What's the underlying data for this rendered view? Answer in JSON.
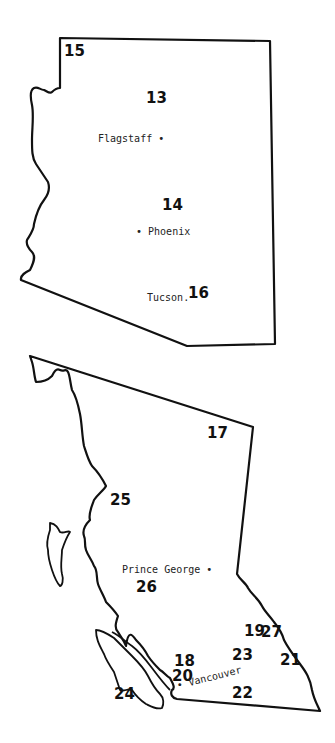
{
  "maps": [
    {
      "region": "Arizona",
      "markers": [
        {
          "id": "15",
          "x": 64,
          "y": 44
        },
        {
          "id": "13",
          "x": 146,
          "y": 91
        },
        {
          "id": "14",
          "x": 162,
          "y": 198
        },
        {
          "id": "16",
          "x": 188,
          "y": 286
        }
      ],
      "cities": [
        {
          "name": "Flagstaff",
          "x": 98,
          "y": 134,
          "dot": "after"
        },
        {
          "name": "Phoenix",
          "x": 136,
          "y": 227,
          "dot": "before"
        },
        {
          "name": "Tucson",
          "x": 147,
          "y": 293,
          "dot": "after"
        }
      ]
    },
    {
      "region": "British Columbia",
      "markers": [
        {
          "id": "17",
          "x": 207,
          "y": 426
        },
        {
          "id": "25",
          "x": 110,
          "y": 493
        },
        {
          "id": "26",
          "x": 136,
          "y": 580
        },
        {
          "id": "19",
          "x": 244,
          "y": 624
        },
        {
          "id": "27",
          "x": 261,
          "y": 625
        },
        {
          "id": "23",
          "x": 232,
          "y": 648
        },
        {
          "id": "21",
          "x": 280,
          "y": 653
        },
        {
          "id": "18",
          "x": 174,
          "y": 654
        },
        {
          "id": "20",
          "x": 172,
          "y": 669
        },
        {
          "id": "22",
          "x": 232,
          "y": 686
        },
        {
          "id": "24",
          "x": 114,
          "y": 687
        }
      ],
      "cities": [
        {
          "name": "Prince George",
          "x": 122,
          "y": 565,
          "dot": "after"
        },
        {
          "name": "Vancouver",
          "x": 177,
          "y": 681,
          "dot": "before",
          "rotate": -14
        }
      ]
    }
  ]
}
